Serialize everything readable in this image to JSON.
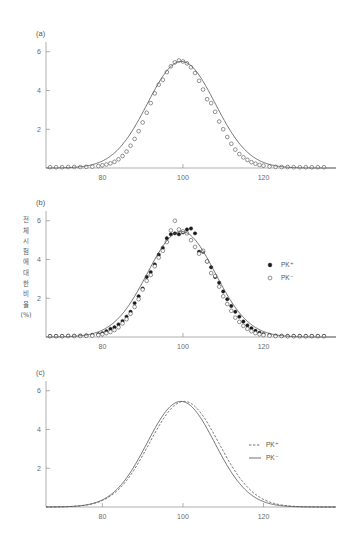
{
  "figure": {
    "background_color": "#ffffff",
    "axis_color": "#8c8c8c",
    "curve_color": "#4d4d4d",
    "marker_fill_color": "#1a1a1a",
    "marker_open_color": "#ffffff"
  },
  "panels": {
    "a": {
      "label": "(a)"
    },
    "b": {
      "label": "(b)"
    },
    "c": {
      "label": "(c)"
    }
  },
  "axis": {
    "y_label_lines": [
      "전",
      "체",
      "시",
      "험",
      "에",
      "대",
      "한",
      "비",
      "율",
      "(%)"
    ],
    "y_label_text": "전체 시험에 대한 비율 (%)",
    "x_ticks": [
      "80",
      "100",
      "120"
    ],
    "y_ticks": [
      "2",
      "4",
      "6"
    ]
  },
  "legend": {
    "b": [
      {
        "marker": "filled-circle",
        "label": "PK⁺"
      },
      {
        "marker": "open-circle",
        "label": "PK⁻"
      }
    ],
    "c": [
      {
        "marker": "dashed-line",
        "label": "PK⁺"
      },
      {
        "marker": "solid-line",
        "label": "PK⁻"
      }
    ]
  },
  "chart_data": [
    {
      "type": "scatter",
      "panel": "a",
      "title": "(a)",
      "xlabel": "",
      "ylabel": "전체 시험에 대한 비율 (%)",
      "xlim": [
        66,
        138
      ],
      "ylim": [
        0,
        6.4
      ],
      "xticks": [
        80,
        100,
        120
      ],
      "yticks": [
        2,
        4,
        6
      ],
      "grid": false,
      "legend_position": "none",
      "series": [
        {
          "name": "observed",
          "marker": "open-circle",
          "x": [
            67,
            68.5,
            70,
            71.5,
            73,
            74.5,
            76,
            77.5,
            79,
            80,
            81,
            82,
            83,
            84,
            85,
            86,
            87,
            88,
            89,
            90,
            91,
            92,
            93,
            94,
            95,
            96,
            97,
            98,
            99,
            100,
            101,
            102,
            103,
            104,
            105,
            106,
            107,
            108,
            109,
            110,
            111,
            112,
            113,
            114,
            115,
            116,
            117,
            118,
            119,
            120,
            121.5,
            123,
            124.5,
            126,
            127.5,
            129,
            130.5,
            132,
            133.5,
            135
          ],
          "y": [
            0.04,
            0.04,
            0.04,
            0.05,
            0.05,
            0.05,
            0.06,
            0.07,
            0.1,
            0.14,
            0.18,
            0.24,
            0.32,
            0.45,
            0.62,
            0.85,
            1.15,
            1.5,
            1.9,
            2.35,
            2.85,
            3.35,
            3.85,
            4.3,
            4.55,
            4.95,
            5.25,
            5.45,
            5.55,
            5.5,
            5.4,
            5.2,
            4.9,
            4.5,
            4.05,
            3.55,
            3.35,
            2.9,
            2.4,
            2.0,
            1.6,
            1.25,
            0.95,
            0.72,
            0.55,
            0.42,
            0.3,
            0.22,
            0.16,
            0.12,
            0.08,
            0.06,
            0.05,
            0.05,
            0.04,
            0.04,
            0.04,
            0.04,
            0.04,
            0.04
          ]
        },
        {
          "name": "fitted-curve",
          "marker": "solid-line",
          "mean": 99.6,
          "sigma": 8.4,
          "amplitude": 5.5
        }
      ]
    },
    {
      "type": "scatter",
      "panel": "b",
      "title": "(b)",
      "xlabel": "",
      "ylabel": "전체 시험에 대한 비율 (%)",
      "xlim": [
        66,
        138
      ],
      "ylim": [
        0,
        6.4
      ],
      "xticks": [
        80,
        100,
        120
      ],
      "yticks": [
        2,
        4,
        6
      ],
      "grid": false,
      "legend_position": "right",
      "series": [
        {
          "name": "PK⁺",
          "marker": "filled-circle",
          "x": [
            67,
            68.5,
            70,
            71.5,
            73,
            74.5,
            76,
            77.5,
            79,
            80,
            81,
            82,
            83,
            84,
            85,
            86,
            87,
            88,
            89,
            90,
            91,
            92,
            93,
            94,
            95,
            96,
            97,
            98,
            99,
            100,
            101,
            102,
            103,
            104,
            105,
            106,
            107,
            108,
            109,
            110,
            111,
            112,
            113,
            114,
            115,
            116,
            117,
            118,
            119,
            120,
            121.5,
            123,
            124.5,
            126,
            127.5,
            129,
            130.5,
            132,
            133.5,
            135
          ],
          "y": [
            0.05,
            0.05,
            0.05,
            0.06,
            0.06,
            0.07,
            0.08,
            0.1,
            0.14,
            0.2,
            0.3,
            0.42,
            0.5,
            0.65,
            0.82,
            1.05,
            1.3,
            1.75,
            2.1,
            2.5,
            3.1,
            3.35,
            3.75,
            4.25,
            4.6,
            5.1,
            5.3,
            5.35,
            5.3,
            5.4,
            5.55,
            5.6,
            5.35,
            4.4,
            4.4,
            3.9,
            3.6,
            3.1,
            2.8,
            2.35,
            1.95,
            1.6,
            1.3,
            1.05,
            0.8,
            0.6,
            0.45,
            0.32,
            0.22,
            0.15,
            0.1,
            0.07,
            0.06,
            0.05,
            0.05,
            0.05,
            0.05,
            0.05,
            0.05,
            0.05
          ]
        },
        {
          "name": "PK⁻",
          "marker": "open-circle",
          "x": [
            67,
            68.5,
            70,
            71.5,
            73,
            74.5,
            76,
            77.5,
            79,
            80,
            81,
            82,
            83,
            84,
            85,
            86,
            87,
            88,
            89,
            90,
            91,
            92,
            93,
            94,
            95,
            96,
            97,
            98,
            99,
            100,
            101,
            102,
            103,
            104,
            105,
            106,
            107,
            108,
            109,
            110,
            111,
            112,
            113,
            114,
            115,
            116,
            117,
            118,
            119,
            120,
            121.5,
            123,
            124.5,
            126,
            127.5,
            129,
            130.5,
            132,
            133.5,
            135
          ],
          "y": [
            0.04,
            0.04,
            0.04,
            0.05,
            0.05,
            0.05,
            0.06,
            0.07,
            0.1,
            0.14,
            0.2,
            0.26,
            0.36,
            0.5,
            0.7,
            0.92,
            1.2,
            1.55,
            1.95,
            2.45,
            2.9,
            3.2,
            3.65,
            4.1,
            4.45,
            4.9,
            5.5,
            6.0,
            5.55,
            5.45,
            5.35,
            5.0,
            4.65,
            4.3,
            4.45,
            3.9,
            3.3,
            3.15,
            2.6,
            2.1,
            1.7,
            1.35,
            1.0,
            0.78,
            0.58,
            0.42,
            0.3,
            0.2,
            0.14,
            0.1,
            0.07,
            0.05,
            0.05,
            0.04,
            0.04,
            0.04,
            0.04,
            0.04,
            0.04,
            0.04
          ]
        },
        {
          "name": "fitted-curve",
          "marker": "solid-line",
          "mean": 99.6,
          "sigma": 8.4,
          "amplitude": 5.45
        }
      ]
    },
    {
      "type": "line",
      "panel": "c",
      "title": "(c)",
      "xlabel": "",
      "ylabel": "전체 시험에 대한 비율 (%)",
      "xlim": [
        66,
        138
      ],
      "ylim": [
        0,
        6.4
      ],
      "xticks": [
        80,
        100,
        120
      ],
      "yticks": [
        2,
        4,
        6
      ],
      "grid": false,
      "legend_position": "right",
      "series": [
        {
          "name": "PK⁺",
          "marker": "dashed-line",
          "mean": 100.3,
          "sigma": 8.6,
          "amplitude": 5.45
        },
        {
          "name": "PK⁻",
          "marker": "solid-line",
          "mean": 99.5,
          "sigma": 8.4,
          "amplitude": 5.45
        }
      ]
    }
  ]
}
